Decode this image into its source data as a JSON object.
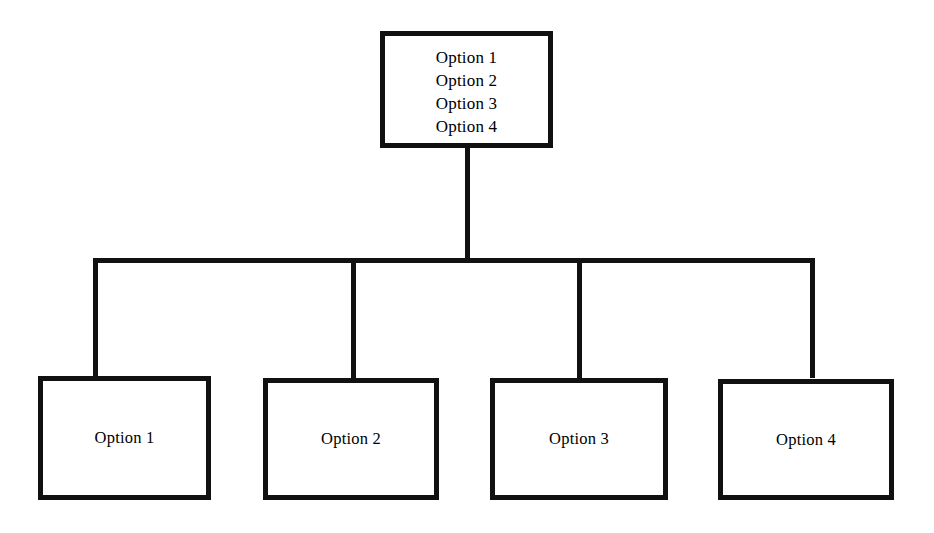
{
  "diagram": {
    "type": "tree",
    "background_color": "#ffffff",
    "stroke_color": "#111111",
    "stroke_width_px": 5,
    "root": {
      "name": "root-node",
      "lines": [
        "Option 1",
        "Option 2",
        "Option 3",
        "Option 4"
      ]
    },
    "children": [
      {
        "name": "leaf-node-1",
        "label": "Option 1"
      },
      {
        "name": "leaf-node-2",
        "label": "Option 2"
      },
      {
        "name": "leaf-node-3",
        "label": "Option 3"
      },
      {
        "name": "leaf-node-4",
        "label": "Option 4"
      }
    ]
  }
}
